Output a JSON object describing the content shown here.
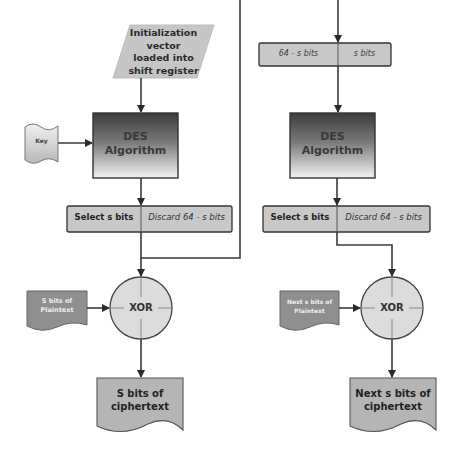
{
  "diagram": {
    "type": "flowchart",
    "title": "",
    "colors": {
      "line": "#3a3a3a",
      "box_fill": "#c8c8c8",
      "doc_fill_light": "#d0d0d0",
      "doc_fill_dark": "#8f8f8f",
      "xor_fill": "#dcdcdc",
      "des_gradient_top": "#3c3c3c",
      "des_gradient_bottom": "#f2f2f2"
    },
    "left": {
      "iv": {
        "line1": "Initialization",
        "line2": "vector",
        "line3": "loaded into",
        "line4": "shift register"
      },
      "key": {
        "label": "Key"
      },
      "des": {
        "line1": "DES",
        "line2": "Algorithm"
      },
      "select": {
        "left": "Select s bits",
        "right": "Discard 64 - s bits"
      },
      "plaintext": {
        "line1": "S bits of",
        "line2": "Plaintext"
      },
      "xor": {
        "label": "XOR"
      },
      "ciphertext": {
        "line1": "S bits of",
        "line2": "ciphertext"
      }
    },
    "right": {
      "register": {
        "left": "64 - s bits",
        "right": "s bits"
      },
      "des": {
        "line1": "DES",
        "line2": "Algorithm"
      },
      "select": {
        "left": "Select s bits",
        "right": "Discard 64 - s bits"
      },
      "plaintext": {
        "line1": "Next s bits of",
        "line2": "Plaintext"
      },
      "xor": {
        "label": "XOR"
      },
      "ciphertext": {
        "line1": "Next s bits of",
        "line2": "ciphertext"
      }
    }
  }
}
